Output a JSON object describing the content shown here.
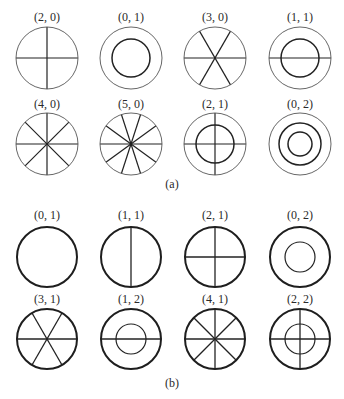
{
  "figure": {
    "panel_a": {
      "caption": "(a)",
      "modes": [
        {
          "label": "(2, 0)",
          "diametral_lines": 2,
          "nodal_circles": 0,
          "col": 0,
          "row": 0
        },
        {
          "label": "(0, 1)",
          "diametral_lines": 0,
          "nodal_circles": 1,
          "col": 1,
          "row": 0
        },
        {
          "label": "(3, 0)",
          "diametral_lines": 3,
          "nodal_circles": 0,
          "col": 2,
          "row": 0
        },
        {
          "label": "(1, 1)",
          "diametral_lines": 1,
          "nodal_circles": 1,
          "col": 3,
          "row": 0
        },
        {
          "label": "(4, 0)",
          "diametral_lines": 4,
          "nodal_circles": 0,
          "col": 0,
          "row": 1
        },
        {
          "label": "(5, 0)",
          "diametral_lines": 5,
          "nodal_circles": 0,
          "col": 1,
          "row": 1
        },
        {
          "label": "(2, 1)",
          "diametral_lines": 2,
          "nodal_circles": 1,
          "col": 2,
          "row": 1
        },
        {
          "label": "(0, 2)",
          "diametral_lines": 0,
          "nodal_circles": 2,
          "col": 3,
          "row": 1
        }
      ]
    },
    "panel_b": {
      "caption": "(b)",
      "modes": [
        {
          "label": "(0, 1)",
          "diametral_lines": 0,
          "nodal_circles": 0,
          "col": 0,
          "row": 0
        },
        {
          "label": "(1, 1)",
          "diametral_lines": 1,
          "nodal_circles": 0,
          "col": 1,
          "row": 0
        },
        {
          "label": "(2, 1)",
          "diametral_lines": 2,
          "nodal_circles": 0,
          "col": 2,
          "row": 0
        },
        {
          "label": "(0, 2)",
          "diametral_lines": 0,
          "nodal_circles": 1,
          "col": 3,
          "row": 0
        },
        {
          "label": "(3, 1)",
          "diametral_lines": 3,
          "nodal_circles": 0,
          "col": 0,
          "row": 1
        },
        {
          "label": "(1, 2)",
          "diametral_lines": 1,
          "nodal_circles": 1,
          "col": 1,
          "row": 1
        },
        {
          "label": "(4, 1)",
          "diametral_lines": 4,
          "nodal_circles": 0,
          "col": 2,
          "row": 1
        },
        {
          "label": "(2, 2)",
          "diametral_lines": 2,
          "nodal_circles": 1,
          "col": 3,
          "row": 1
        }
      ]
    }
  },
  "colors": {
    "line": "#222222",
    "outer_a": "#555555",
    "outer_b": "#1e1e1e"
  }
}
